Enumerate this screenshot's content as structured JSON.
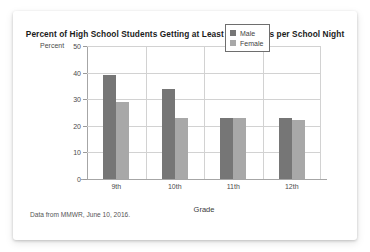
{
  "card": {
    "title": "Percent of High School Students Getting at Least Eight Hours per School Night",
    "source_note": "Data from MMWR, June 10, 2016."
  },
  "legend": {
    "position": "top-right",
    "entries": [
      {
        "label": "Male",
        "color": "#767676"
      },
      {
        "label": "Female",
        "color": "#a8a8a8"
      }
    ]
  },
  "axes": {
    "y_title": "Percent",
    "x_title": "Grade",
    "y_ticks": [
      "0",
      "10",
      "20",
      "30",
      "40",
      "50"
    ],
    "x_ticks": [
      "9th",
      "10th",
      "11th",
      "12th"
    ]
  },
  "chart_data": {
    "type": "bar",
    "title": "Percent of High School Students Getting at Least Eight Hours per School Night",
    "subtitle": "",
    "xlabel": "Grade",
    "ylabel": "Percent",
    "categories": [
      "9th",
      "10th",
      "11th",
      "12th"
    ],
    "series": [
      {
        "name": "Male",
        "color": "#767676",
        "values": [
          39.2,
          33.8,
          23.0,
          22.8
        ]
      },
      {
        "name": "Female",
        "color": "#a8a8a8",
        "values": [
          29.0,
          23.0,
          23.0,
          22.1
        ]
      }
    ],
    "ylim": [
      0,
      50
    ],
    "ytick_interval": 10,
    "grid": "horizontal-and-vertical",
    "legend_position": "top-right",
    "annotations": [
      "Data from MMWR, June 10, 2016."
    ]
  }
}
